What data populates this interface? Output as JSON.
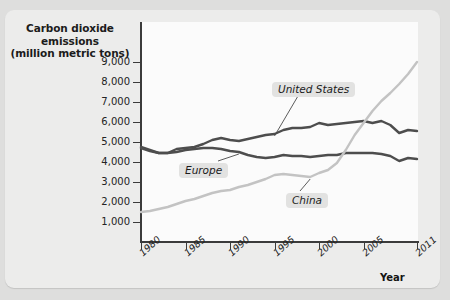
{
  "axis_title_y_line1": "Carbon dioxide emissions",
  "axis_title_y_line2": "(million metric tons)",
  "axis_title_x": "Year",
  "callouts": {
    "united_states": "United States",
    "europe": "Europe",
    "china": "China"
  },
  "colors": {
    "page_background": "#dededd",
    "card_background": "#ececeb",
    "plot_background": "#fbfbfb",
    "axis": "#3b3b3b",
    "united_states": "#4d4d4d",
    "europe": "#4d4d4d",
    "china": "#c3c3c3",
    "callout_background": "#e2e2e1",
    "text": "#1b1b1b"
  },
  "chart_data": {
    "type": "line",
    "title": "",
    "subtitle": "",
    "xlabel": "Year",
    "ylabel": "Carbon dioxide emissions (million metric tons)",
    "xlim": [
      1980,
      2011
    ],
    "ylim": [
      0,
      9500
    ],
    "grid": false,
    "legend": "inline-callouts",
    "y_ticks": [
      1000,
      2000,
      3000,
      4000,
      5000,
      6000,
      7000,
      8000,
      9000
    ],
    "y_tick_labels": [
      "1,000",
      "2,000",
      "3,000",
      "4,000",
      "5,000",
      "6,000",
      "7,000",
      "8,000",
      "9,000"
    ],
    "x_ticks": [
      1980,
      1985,
      1990,
      1995,
      2000,
      2005,
      2011
    ],
    "x_tick_labels": [
      "1980",
      "1985",
      "1990",
      "1995",
      "2000",
      "2005",
      "2011"
    ],
    "x": [
      1980,
      1981,
      1982,
      1983,
      1984,
      1985,
      1986,
      1987,
      1988,
      1989,
      1990,
      1991,
      1992,
      1993,
      1994,
      1995,
      1996,
      1997,
      1998,
      1999,
      2000,
      2001,
      2002,
      2003,
      2004,
      2005,
      2006,
      2007,
      2008,
      2009,
      2010,
      2011
    ],
    "series": [
      {
        "name": "United States",
        "color": "#4d4d4d",
        "values": [
          4750,
          4600,
          4450,
          4450,
          4650,
          4700,
          4750,
          4900,
          5100,
          5200,
          5100,
          5050,
          5150,
          5250,
          5350,
          5400,
          5600,
          5700,
          5700,
          5750,
          5950,
          5850,
          5900,
          5950,
          6000,
          6050,
          5950,
          6050,
          5850,
          5450,
          5600,
          5550
        ]
      },
      {
        "name": "Europe",
        "color": "#4d4d4d",
        "values": [
          4700,
          4550,
          4450,
          4450,
          4500,
          4600,
          4650,
          4700,
          4700,
          4650,
          4550,
          4500,
          4350,
          4250,
          4200,
          4250,
          4350,
          4300,
          4300,
          4250,
          4300,
          4350,
          4350,
          4450,
          4450,
          4450,
          4450,
          4400,
          4300,
          4050,
          4200,
          4150
        ]
      },
      {
        "name": "China",
        "color": "#c3c3c3",
        "values": [
          1500,
          1550,
          1650,
          1750,
          1900,
          2050,
          2150,
          2300,
          2450,
          2550,
          2600,
          2750,
          2850,
          3000,
          3150,
          3350,
          3400,
          3350,
          3300,
          3250,
          3450,
          3600,
          3950,
          4600,
          5350,
          5950,
          6550,
          7050,
          7450,
          7900,
          8400,
          9000
        ]
      }
    ],
    "annotations": [
      {
        "text": "United States",
        "for": "United States",
        "points_to_year": 1995
      },
      {
        "text": "Europe",
        "for": "Europe",
        "points_to_year": 1991
      },
      {
        "text": "China",
        "for": "China",
        "points_to_year": 1999
      }
    ]
  }
}
